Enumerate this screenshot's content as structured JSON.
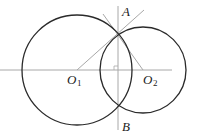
{
  "figure": {
    "points": {
      "A": {
        "label": "A",
        "x": 118,
        "y": 31
      },
      "B": {
        "label": "B",
        "x": 118,
        "y": 105
      },
      "O1": {
        "label": "O",
        "subscript": "1",
        "x": 77,
        "y": 70
      },
      "O2": {
        "label": "O",
        "subscript": "2",
        "x": 143,
        "y": 70
      }
    },
    "circles": [
      {
        "name": "circle-o1",
        "cx": 77,
        "cy": 70,
        "r": 55
      },
      {
        "name": "circle-o2",
        "cx": 143,
        "cy": 70,
        "r": 43
      }
    ],
    "colors": {
      "circle": "#2a2a2a",
      "line": "#a8a8a8",
      "text": "#222222"
    },
    "right_angle_mark": true
  }
}
